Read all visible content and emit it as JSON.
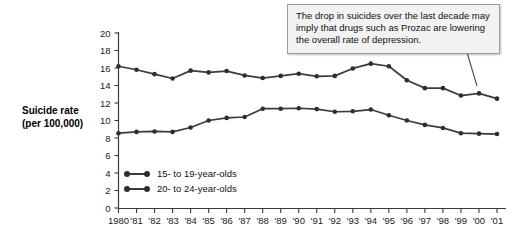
{
  "chart_data": {
    "type": "line",
    "title": "",
    "xlabel": "",
    "ylabel": "Suicide rate (per 100,000)",
    "ylim": [
      0,
      20
    ],
    "ytick_step": 2,
    "grid": false,
    "legend_position": "inside-lower-left",
    "x": [
      1980,
      1981,
      1982,
      1983,
      1984,
      1985,
      1986,
      1987,
      1988,
      1989,
      1990,
      1991,
      1992,
      1993,
      1994,
      1995,
      1996,
      1997,
      1998,
      1999,
      2000,
      2001
    ],
    "categories": [
      "1980",
      "'81",
      "'82",
      "'83",
      "'84",
      "'85",
      "'86",
      "'87",
      "'88",
      "'89",
      "'90",
      "'91",
      "'92",
      "'93",
      "'94",
      "'95",
      "'96",
      "'97",
      "'98",
      "'99",
      "'00",
      "'01"
    ],
    "ytick_labels": [
      "0",
      "2",
      "4",
      "6",
      "8",
      "10",
      "12",
      "14",
      "16",
      "18",
      "20"
    ],
    "series": [
      {
        "name": "15- to 19-year-olds",
        "values": [
          16.2,
          15.8,
          15.3,
          14.8,
          15.7,
          15.5,
          15.65,
          15.15,
          14.85,
          15.1,
          15.35,
          15.05,
          15.1,
          15.95,
          16.5,
          16.2,
          14.6,
          13.7,
          13.7,
          12.85,
          13.1,
          12.5
        ]
      },
      {
        "name": "20- to 24-year-olds",
        "values": [
          8.55,
          8.7,
          8.75,
          8.7,
          9.2,
          10.0,
          10.3,
          10.4,
          11.35,
          11.35,
          11.4,
          11.3,
          11.0,
          11.05,
          11.25,
          10.6,
          10.0,
          9.5,
          9.15,
          8.55,
          8.5,
          8.45
        ]
      }
    ],
    "annotations": [
      {
        "name": "prozac-callout",
        "text": "The drop in suicides over the last decade may imply that drugs such as Prozac are lowering the overall rate of depression.",
        "points_to_year": 2000
      }
    ]
  },
  "axis_title": {
    "line1": "Suicide rate",
    "line2": "(per 100,000)"
  },
  "colors": {
    "line": "#3c3c3c",
    "marker": "#2e2e2e",
    "axis": "#3a3a3a",
    "callout_bg": "#f2f2f2",
    "callout_border": "#9a9a9a",
    "background": "#ffffff"
  }
}
